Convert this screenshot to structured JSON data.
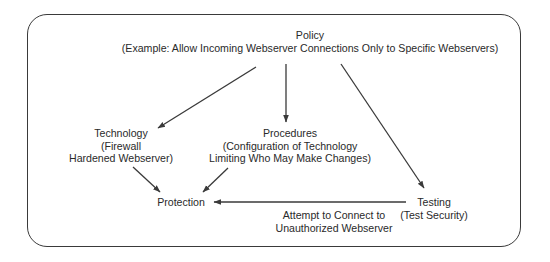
{
  "diagram": {
    "type": "flow",
    "nodes": {
      "policy": {
        "title": "Policy",
        "detail": "(Example: Allow Incoming Webserver Connections Only to Specific Webservers)"
      },
      "technology": {
        "title": "Technology",
        "detail_1": "(Firewall",
        "detail_2": "Hardened Webserver)"
      },
      "procedures": {
        "title": "Procedures",
        "detail_1": "(Configuration of Technology",
        "detail_2": "Limiting Who May Make Changes)"
      },
      "protection": {
        "title": "Protection"
      },
      "testing": {
        "title": "Testing",
        "detail": "(Test Security)"
      }
    },
    "edges": [
      {
        "from": "policy",
        "to": "technology"
      },
      {
        "from": "policy",
        "to": "procedures"
      },
      {
        "from": "policy",
        "to": "testing"
      },
      {
        "from": "technology",
        "to": "protection"
      },
      {
        "from": "procedures",
        "to": "protection"
      },
      {
        "from": "testing",
        "to": "protection",
        "label_1": "Attempt to Connect to",
        "label_2": "Unauthorized Webserver"
      }
    ],
    "colors": {
      "line": "#3a3a3a",
      "text": "#2a2a2a",
      "background": "#ffffff"
    }
  }
}
